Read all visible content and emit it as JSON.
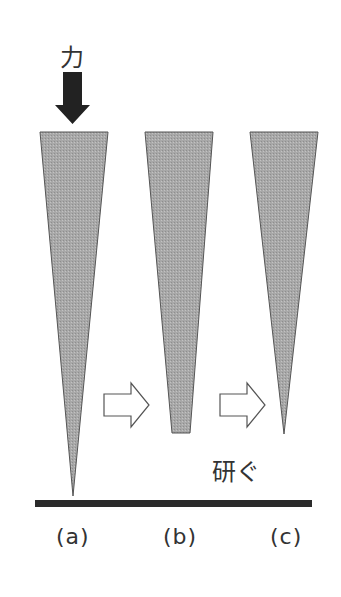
{
  "diagram": {
    "force_label": "力",
    "grind_label": "研ぐ",
    "stages": [
      {
        "id": "a",
        "label": "(a)",
        "tip": "sharp"
      },
      {
        "id": "b",
        "label": "(b)",
        "tip": "flat"
      },
      {
        "id": "c",
        "label": "(c)",
        "tip": "sharp"
      }
    ],
    "icons": {
      "force_arrow": "down-arrow-solid",
      "transition_arrow": "right-arrow-outline"
    },
    "colors": {
      "wedge_fill": "#a9a9a9",
      "wedge_stroke": "#555555",
      "arrow_fill": "#222222",
      "surface": "#2b2b2b",
      "text": "#333333"
    }
  }
}
